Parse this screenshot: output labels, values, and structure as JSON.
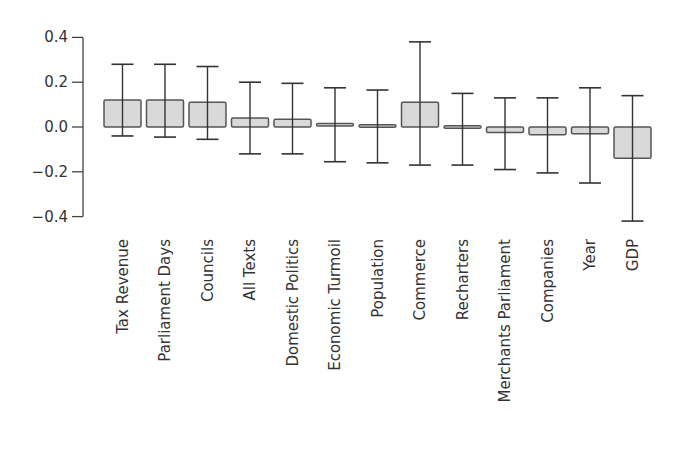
{
  "chart_data": {
    "type": "bar",
    "title": "",
    "xlabel": "",
    "ylabel": "",
    "ylim": [
      -0.4,
      0.4
    ],
    "yticks": [
      0.4,
      0.2,
      0.0,
      -0.2,
      -0.4
    ],
    "ytick_labels": [
      "0.4",
      "0.2",
      "0.0",
      "−0.2",
      "−0.4"
    ],
    "grid": false,
    "legend": null,
    "bar_fill": "#d9d9d9",
    "bar_stroke": "#555555",
    "errorbar_color": "#333333",
    "categories": [
      "Tax Revenue",
      "Parliament Days",
      "Councils",
      "All Texts",
      "Domestic Politics",
      "Economic Turmoil",
      "Population",
      "Commerce",
      "Recharters",
      "Merchants Parliament",
      "Companies",
      "Year",
      "GDP"
    ],
    "values": [
      0.12,
      0.12,
      0.11,
      0.04,
      0.035,
      0.01,
      0.005,
      0.11,
      -0.01,
      -0.025,
      -0.035,
      -0.03,
      -0.14
    ],
    "error_low": [
      -0.04,
      -0.045,
      -0.055,
      -0.12,
      -0.12,
      -0.155,
      -0.16,
      -0.17,
      -0.17,
      -0.19,
      -0.205,
      -0.25,
      -0.42
    ],
    "error_high": [
      0.28,
      0.28,
      0.27,
      0.2,
      0.195,
      0.175,
      0.165,
      0.38,
      0.15,
      0.13,
      0.13,
      0.175,
      0.14
    ]
  }
}
